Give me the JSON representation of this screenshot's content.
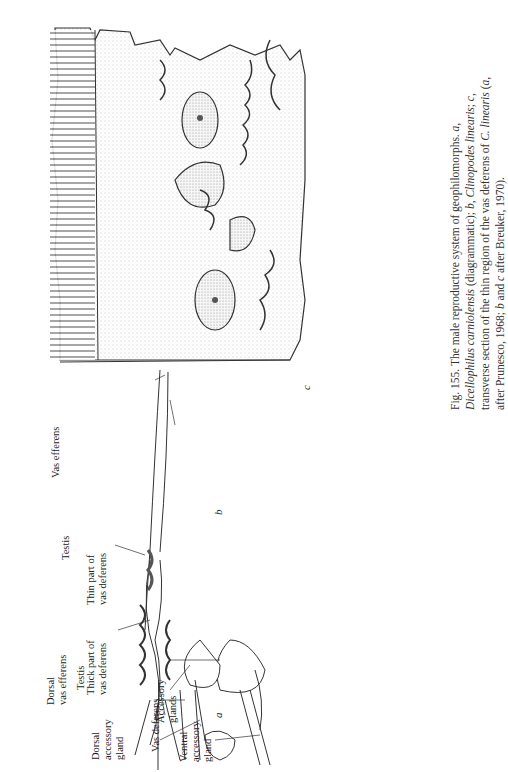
{
  "figure": {
    "number": "Fig. 155.",
    "caption_parts": [
      {
        "text": "Fig. 155. The male reproductive system of geophilomorphs. ",
        "italic": false
      },
      {
        "text": "a",
        "italic": true
      },
      {
        "text": ", ",
        "italic": false
      },
      {
        "text": "Dicellophilus carniolensis",
        "italic": true
      },
      {
        "text": " (diagrammatic); ",
        "italic": false
      },
      {
        "text": "b",
        "italic": true
      },
      {
        "text": ", ",
        "italic": false
      },
      {
        "text": "Clinopodes linearis",
        "italic": true
      },
      {
        "text": "; ",
        "italic": false
      },
      {
        "text": "c",
        "italic": true
      },
      {
        "text": ", transverse section of the thin region of the vas deferens of ",
        "italic": false
      },
      {
        "text": "C. linearis",
        "italic": true
      },
      {
        "text": " (",
        "italic": false
      },
      {
        "text": "a",
        "italic": true
      },
      {
        "text": ", after Prunesco, 1968; ",
        "italic": false
      },
      {
        "text": "b",
        "italic": true
      },
      {
        "text": " and ",
        "italic": false
      },
      {
        "text": "c",
        "italic": true
      },
      {
        "text": " after Breuker, 1970).",
        "italic": false
      }
    ]
  },
  "panels": {
    "a": {
      "letter": "a",
      "labels": {
        "dorsal_vas_efferens_1": "Dorsal",
        "dorsal_vas_efferens_2": "vas efferens",
        "testis": "Testis",
        "dorsal_accessory_gland_1": "Dorsal",
        "dorsal_accessory_gland_2": "accessory",
        "dorsal_accessory_gland_3": "gland",
        "vas_deferens": "Vas deferens",
        "ventral_accessory_gland_1": "Ventral",
        "ventral_accessory_gland_2": "accessory",
        "ventral_accessory_gland_3": "gland"
      }
    },
    "b": {
      "letter": "b",
      "labels": {
        "vas_efferens": "Vas efferens",
        "testis": "Testis",
        "thin_part_1": "Thin part of",
        "thin_part_2": "vas deferens",
        "thick_part_1": "Thick part of",
        "thick_part_2": "vas deferens",
        "accessory_glands_1": "Accessory",
        "accessory_glands_2": "glands"
      }
    },
    "c": {
      "letter": "c"
    }
  }
}
